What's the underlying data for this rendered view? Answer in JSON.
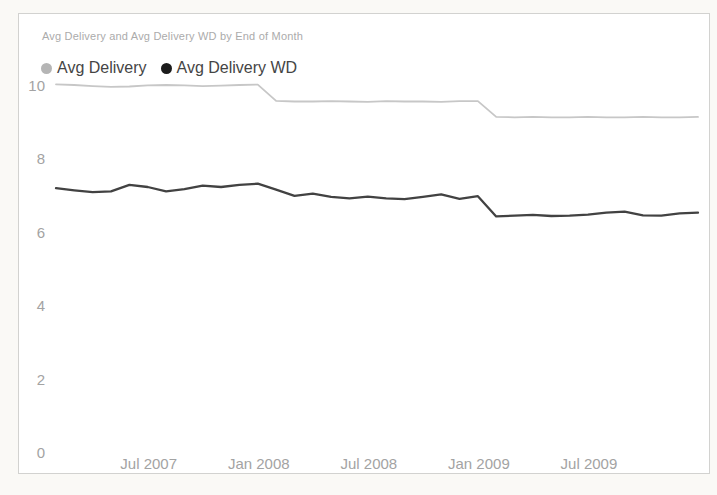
{
  "chart": {
    "title": "Avg Delivery and Avg Delivery WD by End of Month",
    "legend": {
      "items": [
        {
          "label": "Avg Delivery",
          "marker_color": "#b5b5b5"
        },
        {
          "label": "Avg Delivery WD",
          "marker_color": "#1c1c1c"
        }
      ]
    }
  },
  "chart_data": {
    "type": "line",
    "title": "Avg Delivery and Avg Delivery WD by End of Month",
    "xlabel": "End of Month",
    "ylabel": "",
    "ylim": [
      0,
      10
    ],
    "y_ticks": [
      0,
      2,
      4,
      6,
      8,
      10
    ],
    "grid": false,
    "legend_position": "top-left",
    "x": [
      "Jan 2007",
      "Feb 2007",
      "Mar 2007",
      "Apr 2007",
      "May 2007",
      "Jun 2007",
      "Jul 2007",
      "Aug 2007",
      "Sep 2007",
      "Oct 2007",
      "Nov 2007",
      "Dec 2007",
      "Jan 2008",
      "Feb 2008",
      "Mar 2008",
      "Apr 2008",
      "May 2008",
      "Jun 2008",
      "Jul 2008",
      "Aug 2008",
      "Sep 2008",
      "Oct 2008",
      "Nov 2008",
      "Dec 2008",
      "Jan 2009",
      "Feb 2009",
      "Mar 2009",
      "Apr 2009",
      "May 2009",
      "Jun 2009",
      "Jul 2009",
      "Aug 2009",
      "Sep 2009",
      "Oct 2009",
      "Nov 2009",
      "Dec 2009"
    ],
    "x_tick_labels": [
      {
        "label": "Jul 2007",
        "month_index": 5
      },
      {
        "label": "Jan 2008",
        "month_index": 11
      },
      {
        "label": "Jul 2008",
        "month_index": 17
      },
      {
        "label": "Jan 2009",
        "month_index": 23
      },
      {
        "label": "Jul 2009",
        "month_index": 29
      }
    ],
    "series": [
      {
        "name": "Avg Delivery",
        "color": "#c7c7c7",
        "values": [
          10.02,
          10.0,
          9.97,
          9.95,
          9.96,
          9.99,
          10.0,
          9.99,
          9.97,
          9.98,
          10.0,
          10.01,
          9.57,
          9.55,
          9.55,
          9.56,
          9.55,
          9.54,
          9.56,
          9.55,
          9.55,
          9.54,
          9.56,
          9.56,
          9.13,
          9.12,
          9.13,
          9.12,
          9.12,
          9.13,
          9.12,
          9.12,
          9.13,
          9.12,
          9.12,
          9.13
        ]
      },
      {
        "name": "Avg Delivery WD",
        "color": "#424242",
        "values": [
          7.19,
          7.13,
          7.08,
          7.1,
          7.28,
          7.22,
          7.1,
          7.16,
          7.26,
          7.22,
          7.28,
          7.31,
          7.15,
          6.98,
          7.04,
          6.95,
          6.91,
          6.96,
          6.91,
          6.89,
          6.95,
          7.02,
          6.9,
          6.97,
          6.42,
          6.44,
          6.46,
          6.43,
          6.44,
          6.47,
          6.52,
          6.55,
          6.45,
          6.44,
          6.5,
          6.52
        ]
      }
    ]
  }
}
